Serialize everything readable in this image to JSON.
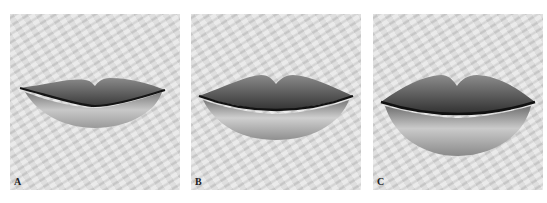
{
  "figure": {
    "panels": [
      {
        "label": "A",
        "description": "thin lips"
      },
      {
        "label": "B",
        "description": "medium lips"
      },
      {
        "label": "C",
        "description": "full lips"
      }
    ]
  }
}
